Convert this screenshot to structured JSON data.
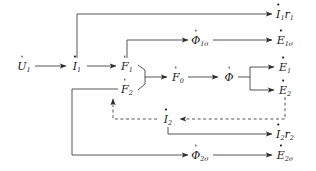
{
  "diagram": {
    "stroke_color": "#2b2b2b",
    "text_color": "#1a1a1a",
    "background": "#ffffff",
    "nodes": [
      {
        "id": "u1",
        "symbol": "U",
        "sub": "1",
        "dot": true,
        "x": 24,
        "y": 66,
        "label": "U̇1"
      },
      {
        "id": "i1",
        "symbol": "I",
        "sub": "1",
        "dot": true,
        "x": 77,
        "y": 66,
        "label": "İ1"
      },
      {
        "id": "f1",
        "symbol": "F",
        "sub": "1",
        "dot": true,
        "x": 127,
        "y": 66,
        "label": "Ḟ1"
      },
      {
        "id": "f2",
        "symbol": "F",
        "sub": "2",
        "dot": true,
        "x": 127,
        "y": 89,
        "label": "Ḟ2"
      },
      {
        "id": "f0",
        "symbol": "F",
        "sub": "0",
        "dot": true,
        "x": 178,
        "y": 77,
        "label": "Ḟ0"
      },
      {
        "id": "phi",
        "symbol": "Φ",
        "sub": "",
        "dot": true,
        "x": 229,
        "y": 77,
        "label": "Φ̇"
      },
      {
        "id": "e1",
        "symbol": "E",
        "sub": "1",
        "dot": true,
        "x": 285,
        "y": 67,
        "label": "Ė1"
      },
      {
        "id": "e2",
        "symbol": "E",
        "sub": "2",
        "dot": true,
        "x": 285,
        "y": 90,
        "label": "Ė2"
      },
      {
        "id": "phi1s",
        "symbol": "Φ",
        "sub": "1σ",
        "dot": true,
        "x": 200,
        "y": 40,
        "label": "Φ̇1σ"
      },
      {
        "id": "e1s",
        "symbol": "E",
        "sub": "1σ",
        "dot": true,
        "x": 285,
        "y": 40,
        "label": "Ė1σ"
      },
      {
        "id": "i1r1",
        "symbol": "I",
        "sub": "1",
        "dot": true,
        "x": 285,
        "y": 14,
        "trail": "r",
        "trailsub": "1",
        "label": "İ1r1"
      },
      {
        "id": "i2",
        "symbol": "I",
        "sub": "2",
        "dot": true,
        "x": 168,
        "y": 119,
        "label": "İ2"
      },
      {
        "id": "i2r2",
        "symbol": "I",
        "sub": "2",
        "dot": true,
        "x": 285,
        "y": 134,
        "trail": "r",
        "trailsub": "2",
        "label": "İ2r2"
      },
      {
        "id": "phi2s",
        "symbol": "Φ",
        "sub": "2σ",
        "dot": true,
        "x": 200,
        "y": 155,
        "label": "Φ̇2σ"
      },
      {
        "id": "e2s",
        "symbol": "E",
        "sub": "2σ",
        "dot": true,
        "x": 285,
        "y": 155,
        "label": "Ė2σ"
      }
    ],
    "edges": [
      {
        "id": "u1-i1",
        "style": "solid",
        "from": "u1",
        "to": "i1",
        "desc": "voltage to primary current"
      },
      {
        "id": "i1-f1",
        "style": "solid",
        "from": "i1",
        "to": "f1",
        "desc": "primary current to primary mmf"
      },
      {
        "id": "i1-i1r1",
        "style": "solid",
        "from": "i1",
        "to": "i1r1",
        "desc": "primary current to primary resistive drop"
      },
      {
        "id": "f1f2-f0",
        "style": "solid",
        "from": "f1,f2",
        "to": "f0",
        "desc": "mmf summation bracket to resultant mmf"
      },
      {
        "id": "f1-phi1s",
        "style": "solid",
        "from": "f1",
        "to": "phi1s",
        "desc": "primary mmf to primary leakage flux"
      },
      {
        "id": "phi1s-e1s",
        "style": "solid",
        "from": "phi1s",
        "to": "e1s",
        "desc": "primary leakage flux to primary leakage emf"
      },
      {
        "id": "f0-phi",
        "style": "solid",
        "from": "f0",
        "to": "phi",
        "desc": "resultant mmf to main flux"
      },
      {
        "id": "phi-e1e2",
        "style": "solid",
        "from": "phi",
        "to": "e1,e2",
        "desc": "main flux to induced emfs"
      },
      {
        "id": "e2-i2",
        "style": "dashed",
        "from": "e2",
        "to": "i2",
        "desc": "secondary emf to secondary current"
      },
      {
        "id": "i2-f2",
        "style": "dashed",
        "from": "i2",
        "to": "f2",
        "desc": "secondary current to secondary mmf"
      },
      {
        "id": "i2-i2r2",
        "style": "solid",
        "from": "i2",
        "to": "i2r2",
        "desc": "secondary current to secondary resistive drop"
      },
      {
        "id": "i2-phi2s",
        "style": "solid",
        "from": "i2",
        "to": "phi2s",
        "desc": "secondary current to secondary leakage flux"
      },
      {
        "id": "phi2s-e2s",
        "style": "solid",
        "from": "phi2s",
        "to": "e2s",
        "desc": "secondary leakage flux to secondary leakage emf"
      }
    ]
  }
}
